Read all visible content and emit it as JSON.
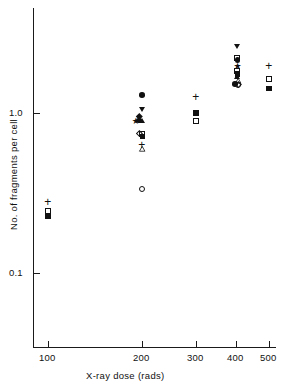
{
  "chart_data": {
    "type": "scatter",
    "title": "",
    "xlabel": "X-ray dose (rads)",
    "ylabel": "No. of fragments per cell",
    "yscale": "log",
    "ylim": [
      0.07,
      3.2
    ],
    "ytick_labels": [
      "1.0",
      "0.1"
    ],
    "ytick_values": [
      1.0,
      0.1
    ],
    "xtick_labels": [
      "100",
      "200",
      "300",
      "400",
      "500"
    ],
    "xtick_values": [
      100,
      200,
      300,
      400,
      500
    ],
    "grid": false,
    "legend": "none",
    "marker_kinds": [
      "filled-circle",
      "open-circle",
      "filled-square",
      "open-square",
      "filled-triangle-up",
      "open-triangle-up",
      "filled-triangle-down",
      "open-diamond",
      "filled-diamond",
      "star",
      "plus"
    ],
    "points": [
      {
        "x": 100,
        "y": 0.285,
        "marker": "plus"
      },
      {
        "x": 100,
        "y": 0.245,
        "marker": "open-square"
      },
      {
        "x": 100,
        "y": 0.225,
        "marker": "filled-square"
      },
      {
        "x": 200,
        "y": 1.3,
        "marker": "filled-circle"
      },
      {
        "x": 200,
        "y": 1.04,
        "marker": "filled-triangle-down"
      },
      {
        "x": 197,
        "y": 0.95,
        "marker": "filled-diamond"
      },
      {
        "x": 193,
        "y": 0.9,
        "marker": "star"
      },
      {
        "x": 197,
        "y": 0.9,
        "marker": "filled-circle"
      },
      {
        "x": 201,
        "y": 0.9,
        "marker": "filled-triangle-up"
      },
      {
        "x": 197,
        "y": 0.745,
        "marker": "open-diamond"
      },
      {
        "x": 201,
        "y": 0.735,
        "marker": "open-square"
      },
      {
        "x": 201,
        "y": 0.715,
        "marker": "filled-square"
      },
      {
        "x": 200,
        "y": 0.655,
        "marker": "plus"
      },
      {
        "x": 200,
        "y": 0.6,
        "marker": "open-triangle-up"
      },
      {
        "x": 200,
        "y": 0.335,
        "marker": "open-circle"
      },
      {
        "x": 300,
        "y": 1.3,
        "marker": "plus"
      },
      {
        "x": 300,
        "y": 1.0,
        "marker": "filled-square"
      },
      {
        "x": 300,
        "y": 0.885,
        "marker": "open-square"
      },
      {
        "x": 404,
        "y": 2.6,
        "marker": "filled-triangle-down"
      },
      {
        "x": 404,
        "y": 2.21,
        "marker": "open-square"
      },
      {
        "x": 404,
        "y": 2.14,
        "marker": "filled-circle"
      },
      {
        "x": 404,
        "y": 1.97,
        "marker": "star"
      },
      {
        "x": 404,
        "y": 1.82,
        "marker": "open-square"
      },
      {
        "x": 404,
        "y": 1.76,
        "marker": "filled-square"
      },
      {
        "x": 404,
        "y": 1.69,
        "marker": "filled-triangle-up"
      },
      {
        "x": 406,
        "y": 1.58,
        "marker": "open-triangle-up"
      },
      {
        "x": 398,
        "y": 1.52,
        "marker": "filled-circle"
      },
      {
        "x": 405,
        "y": 1.5,
        "marker": "open-circle"
      },
      {
        "x": 409,
        "y": 1.51,
        "marker": "open-diamond"
      },
      {
        "x": 500,
        "y": 2.02,
        "marker": "plus"
      },
      {
        "x": 500,
        "y": 1.62,
        "marker": "open-square"
      },
      {
        "x": 500,
        "y": 1.42,
        "marker": "filled-square"
      }
    ]
  },
  "axes": {
    "y_tick_top": "1.0",
    "y_tick_bottom": "0.1",
    "x_ticks": [
      "100",
      "200",
      "300",
      "400",
      "500"
    ],
    "x_axis_title": "X-ray dose (rads)",
    "y_axis_title": "No. of fragments per cell"
  }
}
